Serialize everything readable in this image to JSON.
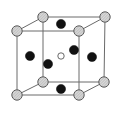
{
  "diagram": {
    "title": "",
    "type": "face-centered cubic unit cell with body-center site",
    "colors": {
      "background": "#ffffff",
      "edge": "#6a6a6a",
      "corner_fill": "#d4d4d4",
      "corner_stroke": "#5a5a5a",
      "face_atom": "#111111",
      "body_center_fill": "#ffffff",
      "body_center_stroke": "#444444"
    },
    "corner_atoms": [
      {
        "id": "back-top-left",
        "x": 43,
        "y": 17
      },
      {
        "id": "back-top-right",
        "x": 105,
        "y": 17
      },
      {
        "id": "front-top-left",
        "x": 17,
        "y": 31
      },
      {
        "id": "front-top-right",
        "x": 79,
        "y": 31
      },
      {
        "id": "back-bottom-left",
        "x": 43,
        "y": 82
      },
      {
        "id": "back-bottom-right",
        "x": 104,
        "y": 82
      },
      {
        "id": "front-bottom-left",
        "x": 17,
        "y": 95
      },
      {
        "id": "front-bottom-right",
        "x": 79,
        "y": 95
      }
    ],
    "face_atoms": [
      {
        "id": "top",
        "x": 61,
        "y": 24
      },
      {
        "id": "bottom",
        "x": 61,
        "y": 89
      },
      {
        "id": "left",
        "x": 30,
        "y": 56
      },
      {
        "id": "right",
        "x": 92,
        "y": 57
      },
      {
        "id": "front",
        "x": 48,
        "y": 64
      },
      {
        "id": "back",
        "x": 74,
        "y": 50
      }
    ],
    "body_center_atom": {
      "id": "center",
      "x": 61,
      "y": 56
    },
    "labels": []
  }
}
